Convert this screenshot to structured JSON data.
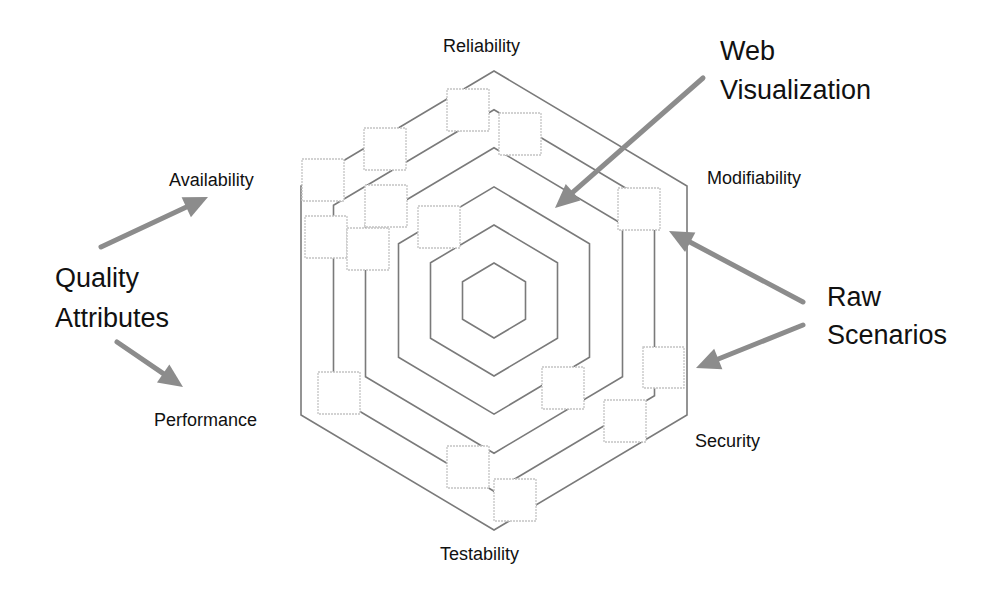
{
  "diagram": {
    "center": [
      494,
      300.5
    ],
    "rings": [
      {
        "half_width": 193,
        "half_height_top": 229.5,
        "half_side": 114.5
      },
      {
        "half_width": 160.5,
        "half_height_top": 190.8,
        "half_side": 95.2
      },
      {
        "half_width": 128.5,
        "half_height_top": 152.7,
        "half_side": 76.2
      },
      {
        "half_width": 95.5,
        "half_height_top": 113.6,
        "half_side": 56.7
      },
      {
        "half_width": 63.5,
        "half_height_top": 75.5,
        "half_side": 37.7
      },
      {
        "half_width": 31.5,
        "half_height_top": 37.5,
        "half_side": 18.7
      }
    ],
    "axes": [
      {
        "name": "reliability",
        "label": "Reliability",
        "x": 443,
        "y": 52,
        "anchor": "start"
      },
      {
        "name": "modifiability",
        "label": "Modifiability",
        "x": 707,
        "y": 184,
        "anchor": "start"
      },
      {
        "name": "security",
        "label": "Security",
        "x": 695,
        "y": 447,
        "anchor": "start"
      },
      {
        "name": "testability",
        "label": "Testability",
        "x": 440,
        "y": 560,
        "anchor": "start"
      },
      {
        "name": "performance",
        "label": "Performance",
        "x": 154,
        "y": 426,
        "anchor": "start"
      },
      {
        "name": "availability",
        "label": "Availability",
        "x": 169,
        "y": 186,
        "anchor": "start"
      }
    ],
    "scenarios": [
      {
        "x": 447,
        "y": 89,
        "size": 42
      },
      {
        "x": 499,
        "y": 113,
        "size": 42
      },
      {
        "x": 364,
        "y": 128,
        "size": 42
      },
      {
        "x": 302,
        "y": 159,
        "size": 42
      },
      {
        "x": 365,
        "y": 185,
        "size": 42
      },
      {
        "x": 305,
        "y": 216,
        "size": 42
      },
      {
        "x": 347,
        "y": 228,
        "size": 42
      },
      {
        "x": 418,
        "y": 206,
        "size": 42
      },
      {
        "x": 618,
        "y": 188,
        "size": 42
      },
      {
        "x": 643,
        "y": 347,
        "size": 41
      },
      {
        "x": 542,
        "y": 367,
        "size": 42
      },
      {
        "x": 604,
        "y": 400,
        "size": 42
      },
      {
        "x": 318,
        "y": 372,
        "size": 42
      },
      {
        "x": 447,
        "y": 446,
        "size": 42
      },
      {
        "x": 494,
        "y": 479,
        "size": 42
      }
    ],
    "callouts": [
      {
        "name": "web-visualization",
        "lines": [
          "Web",
          "Visualization"
        ],
        "x": 720,
        "y": 60,
        "line_height": 39
      },
      {
        "name": "quality-attributes",
        "lines": [
          "Quality",
          "Attributes"
        ],
        "x": 55,
        "y": 287,
        "line_height": 40
      },
      {
        "name": "raw-scenarios",
        "lines": [
          "Raw",
          "Scenarios"
        ],
        "x": 827,
        "y": 306,
        "line_height": 38
      }
    ],
    "arrows": [
      {
        "name": "web-visualization-arrow",
        "from": [
          703,
          78
        ],
        "to": [
          555,
          208
        ]
      },
      {
        "name": "quality-to-availability-arrow",
        "from": [
          101,
          247
        ],
        "to": [
          208,
          197
        ]
      },
      {
        "name": "quality-to-performance-arrow",
        "from": [
          117,
          342
        ],
        "to": [
          183,
          387
        ]
      },
      {
        "name": "raw-to-modifiability-arrow",
        "from": [
          803,
          302
        ],
        "to": [
          669,
          231
        ]
      },
      {
        "name": "raw-to-security-arrow",
        "from": [
          803,
          325
        ],
        "to": [
          696,
          368
        ]
      }
    ],
    "colors": {
      "ring": "#7a7a7a",
      "scenario_border": "#c4c4c4",
      "arrow": "#8c8c8c",
      "text": "#111111",
      "background": "#ffffff"
    }
  }
}
